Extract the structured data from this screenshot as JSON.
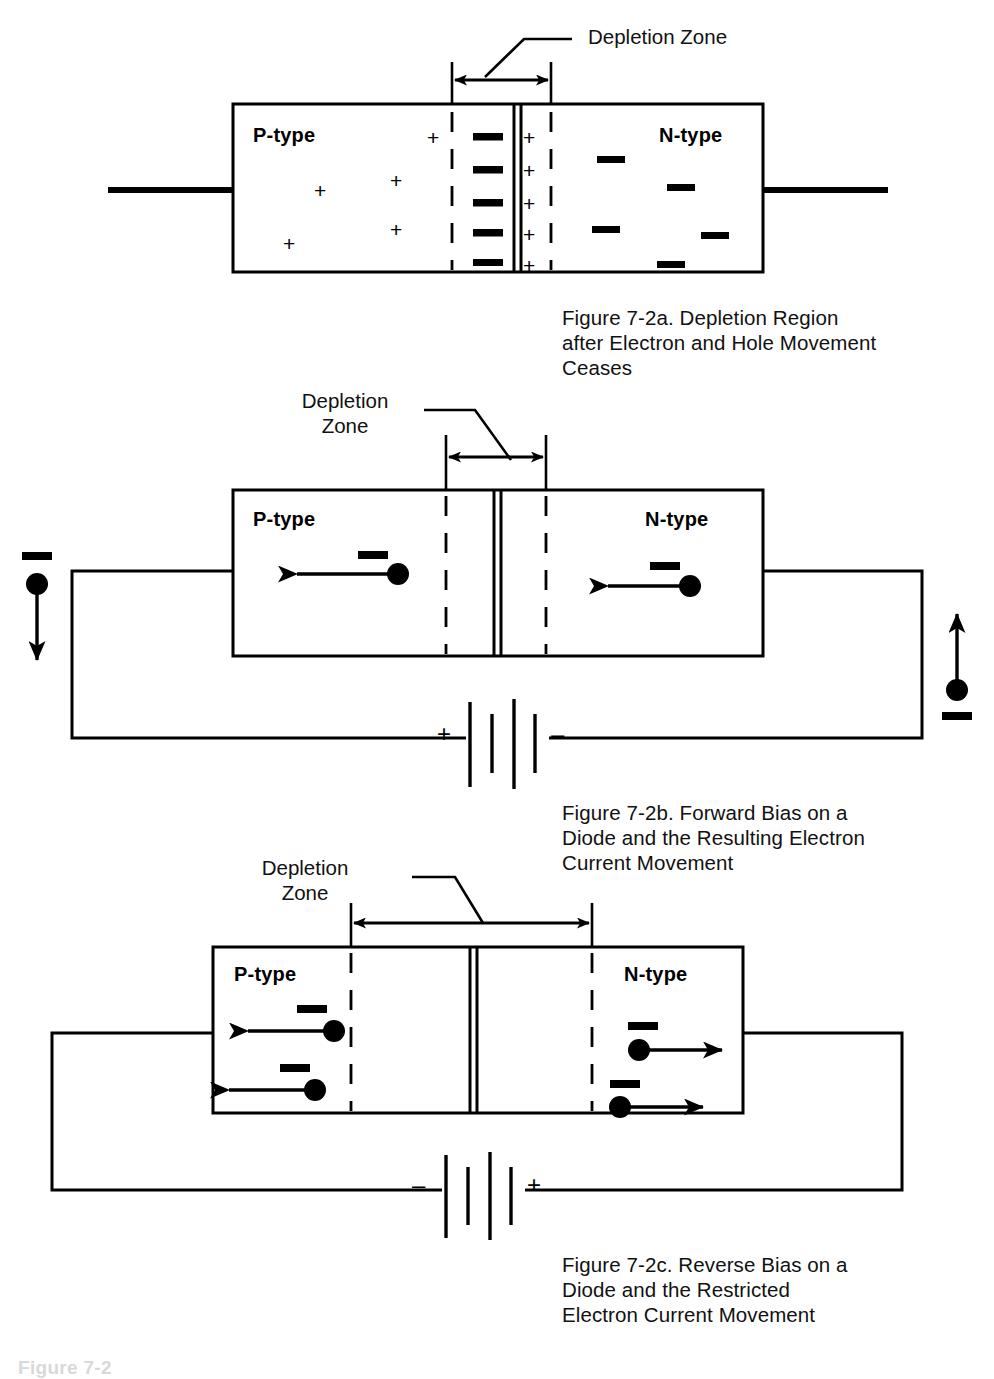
{
  "page": {
    "width": 994,
    "height": 1376,
    "background": "#ffffff",
    "ink": "#000000"
  },
  "figures": [
    {
      "id": "fig-7-2a",
      "zone_label": "Depletion Zone",
      "zone_label_lines": [
        "Depletion Zone"
      ],
      "p_label": "P-type",
      "n_label": "N-type",
      "caption": "Figure 7-2a.  Depletion Region after Electron and Hole Movement Ceases",
      "caption_lines": [
        "Figure 7-2a.  Depletion Region",
        "after Electron and Hole Movement",
        "Ceases"
      ],
      "holes_count": 5,
      "hole_symbol": "+",
      "electron_symbol": "–",
      "junction_minus_count": 5,
      "junction_plus_count": 5,
      "free_electrons_count": 5,
      "has_battery": false,
      "has_circuit": false
    },
    {
      "id": "fig-7-2b",
      "zone_label": "Depletion Zone",
      "zone_label_lines": [
        "Depletion",
        "Zone"
      ],
      "p_label": "P-type",
      "n_label": "N-type",
      "caption": "Figure 7-2b.  Forward Bias on a Diode and the Resulting Electron Current Movement",
      "caption_lines": [
        "Figure 7-2b.  Forward Bias on a",
        "Diode and the Resulting Electron",
        "Current Movement"
      ],
      "battery": {
        "left_terminal": "+",
        "right_terminal": "–"
      },
      "electron_symbol": "–",
      "carriers": [
        {
          "region": "p-type",
          "direction": "left"
        },
        {
          "region": "n-type",
          "direction": "left"
        }
      ],
      "terminals": [
        {
          "side": "left",
          "direction": "down",
          "symbol": "–"
        },
        {
          "side": "right",
          "direction": "up",
          "symbol": "–"
        }
      ],
      "has_battery": true,
      "has_circuit": true
    },
    {
      "id": "fig-7-2c",
      "zone_label": "Depletion Zone",
      "zone_label_lines": [
        "Depletion",
        "Zone"
      ],
      "p_label": "P-type",
      "n_label": "N-type",
      "caption": "Figure 7-2c.  Reverse Bias on a Diode and the Restricted Electron Current Movement",
      "caption_lines": [
        "Figure 7-2c.  Reverse Bias on a",
        "Diode and the Restricted",
        "Electron Current Movement"
      ],
      "battery": {
        "left_terminal": "–",
        "right_terminal": "+"
      },
      "electron_symbol": "–",
      "carriers": [
        {
          "region": "p-type",
          "direction": "left"
        },
        {
          "region": "p-type",
          "direction": "left"
        },
        {
          "region": "n-type",
          "direction": "right"
        },
        {
          "region": "n-type",
          "direction": "right"
        }
      ],
      "has_battery": true,
      "has_circuit": true
    }
  ],
  "footer": {
    "partial_text": "Figure 7-2"
  }
}
